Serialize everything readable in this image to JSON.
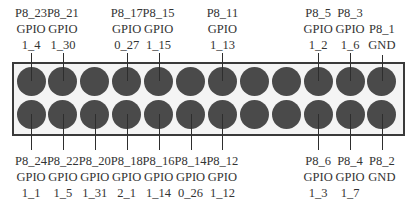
{
  "header": {
    "name": "P8",
    "columns": 12
  },
  "colors": {
    "pin": "#4a4a4a",
    "board_fill": "#f4f4f4",
    "board_border": "#3a3a3a",
    "text": "#333333"
  },
  "top_labels": [
    {
      "col": 0,
      "pin": "P8_23",
      "func": "GPIO",
      "num": "1_4"
    },
    {
      "col": 1,
      "pin": "P8_21",
      "func": "GPIO",
      "num": "1_30"
    },
    {
      "col": 3,
      "pin": "P8_17",
      "func": "GPIO",
      "num": "0_27"
    },
    {
      "col": 4,
      "pin": "P8_15",
      "func": "GPIO",
      "num": "1_15"
    },
    {
      "col": 6,
      "pin": "P8_11",
      "func": "GPIO",
      "num": "1_13"
    },
    {
      "col": 9,
      "pin": "P8_5",
      "func": "GPIO",
      "num": "1_2"
    },
    {
      "col": 10,
      "pin": "P8_3",
      "func": "GPIO",
      "num": "1_6"
    },
    {
      "col": 11,
      "pin": "P8_1",
      "func": "GND",
      "num": ""
    }
  ],
  "bottom_labels": [
    {
      "col": 0,
      "pin": "P8_24",
      "func": "GPIO",
      "num": "1_1"
    },
    {
      "col": 1,
      "pin": "P8_22",
      "func": "GPIO",
      "num": "1_5"
    },
    {
      "col": 2,
      "pin": "P8_20",
      "func": "GPIO",
      "num": "1_31"
    },
    {
      "col": 3,
      "pin": "P8_18",
      "func": "GPIO",
      "num": "2_1"
    },
    {
      "col": 4,
      "pin": "P8_16",
      "func": "GPIO",
      "num": "1_14"
    },
    {
      "col": 5,
      "pin": "P8_14",
      "func": "GPIO",
      "num": "0_26"
    },
    {
      "col": 6,
      "pin": "P8_12",
      "func": "GPIO",
      "num": "1_12"
    },
    {
      "col": 9,
      "pin": "P8_6",
      "func": "GPIO",
      "num": "1_3"
    },
    {
      "col": 10,
      "pin": "P8_4",
      "func": "GPIO",
      "num": "1_7"
    },
    {
      "col": 11,
      "pin": "P8_2",
      "func": "GND",
      "num": ""
    }
  ]
}
